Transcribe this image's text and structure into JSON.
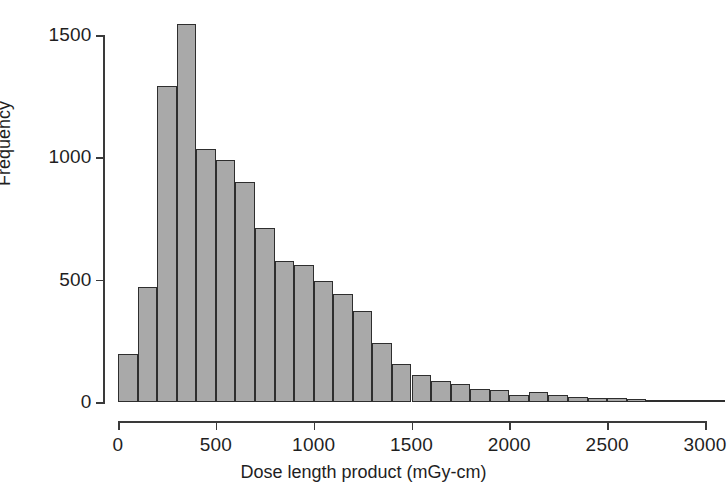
{
  "figure": {
    "background_color": "#ffffff",
    "bar_fill_color": "#a9a9a9",
    "bar_edge_color": "#2e2e2e",
    "axis_color": "#3a3a3a"
  },
  "chart_data": {
    "type": "bar",
    "title": "",
    "subtitle": "",
    "xlabel": "Dose length product (mGy-cm)",
    "ylabel": "Frequency",
    "xlim": [
      0,
      3100
    ],
    "ylim": [
      0,
      1550
    ],
    "grid": false,
    "legend": "none",
    "bin_width": 100,
    "x_ticks": [
      0,
      500,
      1000,
      1500,
      2000,
      2500,
      3000
    ],
    "x_tick_labels": [
      "0",
      "500",
      "1000",
      "1500",
      "2000",
      "2500",
      "3000"
    ],
    "y_ticks": [
      0,
      500,
      1000,
      1500
    ],
    "y_tick_labels": [
      "0",
      "500",
      "1000",
      "1500"
    ],
    "bin_starts": [
      0,
      100,
      200,
      300,
      400,
      500,
      600,
      700,
      800,
      900,
      1000,
      1100,
      1200,
      1300,
      1400,
      1500,
      1600,
      1700,
      1800,
      1900,
      2000,
      2100,
      2200,
      2300,
      2400,
      2500,
      2600,
      2700,
      2800,
      2900,
      3000
    ],
    "bin_centers": [
      50,
      150,
      250,
      350,
      450,
      550,
      650,
      750,
      850,
      950,
      1050,
      1150,
      1250,
      1350,
      1450,
      1550,
      1650,
      1750,
      1850,
      1950,
      2050,
      2150,
      2250,
      2350,
      2450,
      2550,
      2650,
      2750,
      2850,
      2950,
      3050
    ],
    "categories": [
      "0-100",
      "100-200",
      "200-300",
      "300-400",
      "400-500",
      "500-600",
      "600-700",
      "700-800",
      "800-900",
      "900-1000",
      "1000-1100",
      "1100-1200",
      "1200-1300",
      "1300-1400",
      "1400-1500",
      "1500-1600",
      "1600-1700",
      "1700-1800",
      "1800-1900",
      "1900-2000",
      "2000-2100",
      "2100-2200",
      "2200-2300",
      "2300-2400",
      "2400-2500",
      "2500-2600",
      "2600-2700",
      "2700-2800",
      "2800-2900",
      "2900-3000",
      "3000-3100"
    ],
    "values": [
      195,
      470,
      1290,
      1545,
      1035,
      990,
      900,
      710,
      575,
      560,
      495,
      440,
      370,
      240,
      155,
      110,
      85,
      75,
      55,
      50,
      30,
      40,
      28,
      20,
      18,
      16,
      14,
      10,
      8,
      7,
      6
    ]
  }
}
